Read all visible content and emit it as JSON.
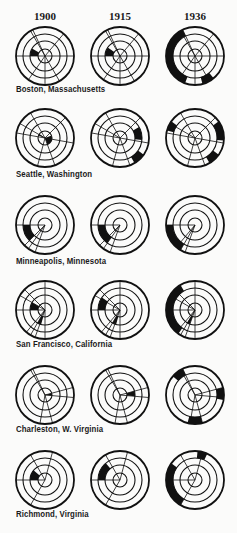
{
  "years": [
    {
      "label": "1900",
      "x": 45
    },
    {
      "label": "1915",
      "x": 120
    },
    {
      "label": "1936",
      "x": 195
    }
  ],
  "geometry": {
    "ring_radii": [
      7,
      15,
      22,
      29
    ],
    "column_x": [
      45,
      120,
      195
    ]
  },
  "rows": [
    {
      "city": "Boston, Massachusetts",
      "cy": 56,
      "label_y": 90,
      "circles": [
        {
          "spokes": [
            -25,
            40,
            90,
            150,
            180,
            215,
            270,
            330
          ],
          "fills": [
            [
              1,
              270,
              300
            ]
          ]
        },
        {
          "spokes": [
            -25,
            40,
            90,
            150,
            180,
            215,
            270,
            330
          ],
          "fills": [
            [
              1,
              270,
              305
            ]
          ]
        },
        {
          "spokes": [
            -25,
            40,
            90,
            150,
            180,
            215,
            270,
            330
          ],
          "fills": [
            [
              3,
              200,
              335
            ],
            [
              3,
              140,
              165
            ]
          ]
        }
      ]
    },
    {
      "city": "Seattle, Washington",
      "cy": 138,
      "label_y": 175,
      "circles": [
        {
          "spokes": [
            -30,
            45,
            100,
            160,
            195,
            280,
            300
          ],
          "fills": [
            [
              0,
              70,
              160
            ],
            [
              0,
              290,
              305
            ]
          ]
        },
        {
          "spokes": [
            -30,
            45,
            100,
            160,
            195,
            280,
            300
          ],
          "fills": [
            [
              2,
              60,
              95
            ],
            [
              3,
              125,
              150
            ]
          ]
        },
        {
          "spokes": [
            -30,
            45,
            100,
            160,
            195,
            280,
            300
          ],
          "fills": [
            [
              3,
              55,
              95
            ],
            [
              3,
              125,
              150
            ],
            [
              3,
              285,
              305
            ]
          ]
        }
      ]
    },
    {
      "city": "Minneapolis, Minnesota",
      "cy": 225,
      "label_y": 262,
      "circles": [
        {
          "spokes": [
            200,
            215,
            225,
            270
          ],
          "fills": [
            [
              2,
              225,
              270
            ]
          ]
        },
        {
          "spokes": [
            200,
            215,
            225,
            270
          ],
          "fills": [
            [
              2,
              215,
              270
            ]
          ]
        },
        {
          "spokes": [
            200,
            210,
            220,
            270
          ],
          "fills": [
            [
              3,
              210,
              270
            ]
          ]
        }
      ]
    },
    {
      "city": "San Francisco, California",
      "cy": 310,
      "label_y": 345,
      "circles": [
        {
          "spokes": [
            0,
            180,
            200,
            210,
            220,
            270,
            300,
            315
          ],
          "fills": [
            [
              1,
              270,
              300
            ],
            [
              1,
              195,
              210
            ]
          ]
        },
        {
          "spokes": [
            0,
            180,
            200,
            210,
            220,
            270,
            300,
            315
          ],
          "fills": [
            [
              2,
              270,
              305
            ],
            [
              1,
              195,
              210
            ]
          ]
        },
        {
          "spokes": [
            0,
            180,
            200,
            210,
            220,
            270,
            300,
            315
          ],
          "fills": [
            [
              3,
              215,
              330
            ],
            [
              1,
              200,
              212
            ]
          ]
        }
      ]
    },
    {
      "city": "Charleston, W. Virginia",
      "cy": 395,
      "label_y": 430,
      "circles": [
        {
          "spokes": [
            -25,
            75,
            95,
            165,
            190,
            330
          ],
          "fills": [
            [
              0,
              75,
              95
            ]
          ]
        },
        {
          "spokes": [
            -25,
            75,
            95,
            165,
            190,
            330
          ],
          "fills": [
            [
              1,
              75,
              95
            ]
          ]
        },
        {
          "spokes": [
            -25,
            75,
            95,
            165,
            190,
            330
          ],
          "fills": [
            [
              3,
              75,
              100
            ],
            [
              3,
              165,
              195
            ],
            [
              3,
              310,
              335
            ]
          ]
        }
      ]
    },
    {
      "city": "Richmond, Virginia",
      "cy": 480,
      "label_y": 515,
      "circles": [
        {
          "spokes": [
            15,
            270,
            330,
            210
          ],
          "fills": [
            [
              1,
              270,
              310
            ]
          ]
        },
        {
          "spokes": [
            15,
            270,
            330,
            210
          ],
          "fills": [
            [
              2,
              270,
              320
            ]
          ]
        },
        {
          "spokes": [
            15,
            270,
            330,
            210
          ],
          "fills": [
            [
              3,
              210,
              305
            ],
            [
              3,
              5,
              25
            ]
          ]
        }
      ]
    }
  ],
  "colors": {
    "ink": "#111111",
    "paper": "#fbfbfa"
  }
}
